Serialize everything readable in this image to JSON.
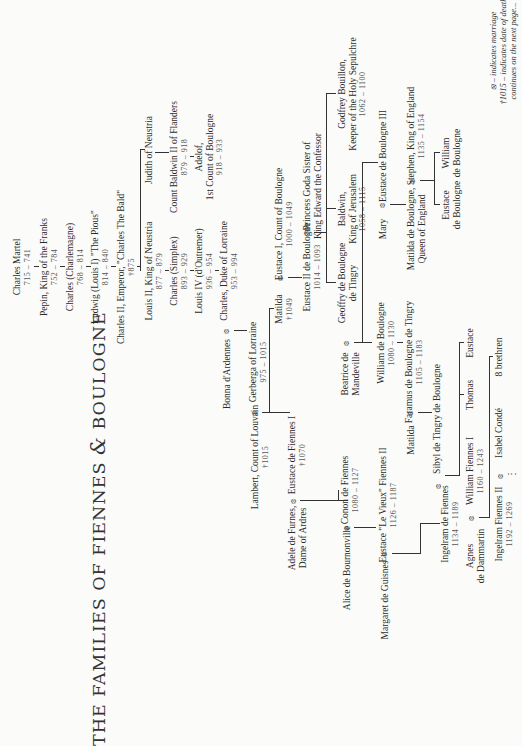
{
  "title": {
    "part1": "THE FAMILIES OF FIENNES ",
    "amp": "&",
    "part2": " BOULOGNE"
  },
  "marriage_symbol": "⦻",
  "people": {
    "charles_martel": {
      "name": "Charles Martel",
      "dates": "715 – 741"
    },
    "pepin": {
      "name": "Pepin, King of the Franks",
      "dates": "752 – 784"
    },
    "charlemagne": {
      "name": "Charles (Charlemagne)",
      "dates": "768 – 814"
    },
    "ludwig": {
      "name": "Ludwig (Louis I) \"The Pious\"",
      "dates": "814 – 840"
    },
    "charles_ii": {
      "name": "Charles II, Emperor, \"Charles The Bald\"",
      "dates": "†875"
    },
    "louis_ii": {
      "name": "Louis II, King of Neustria",
      "dates": "877 – 879"
    },
    "judith": {
      "name": "Judith of Neustria",
      "dates": ""
    },
    "charles_simplex": {
      "name": "Charles (Simplex)",
      "dates": "893 – 929"
    },
    "baldwin_ii": {
      "name": "Count Baldwin II of Flanders",
      "dates": "879 – 918"
    },
    "adelof": {
      "name": "Adelof,",
      "name2": "1st Count of Boulogne",
      "dates": "918 – 933"
    },
    "louis_iv": {
      "name": "Louis IV (d'Outremer)",
      "dates": "936 – 954"
    },
    "charles_lorraine": {
      "name": "Charles, Duke of Lorraine",
      "dates": "953 – 994"
    },
    "bonna": {
      "name": "Bonna d'Ardennes"
    },
    "gerberga": {
      "name": "Gerberga of Lorraine",
      "dates": "975 – 1015"
    },
    "matilda_1049": {
      "name": "Matilda",
      "dates": "†1049"
    },
    "eustace_i": {
      "name": "Eustace I, Count of Boulogne",
      "dates": "1000 – 1049"
    },
    "eustace_ii": {
      "name": "Eustace II de Boulogne",
      "dates": "1014 – 1093"
    },
    "goda": {
      "name": "Princess Goda Sister of",
      "name2": "King Edward the Confessor"
    },
    "lambert": {
      "name": "Lambert, Count of Louvain",
      "dates": "†1015"
    },
    "eustace_fiennes_i": {
      "name": "Eustace de Fiennes I",
      "dates": "†1070"
    },
    "adele": {
      "name": "Adele de Furnes,",
      "name2": "Dame of Ardres"
    },
    "beatrice": {
      "name": "Beatrice de",
      "name2": "Mandeville"
    },
    "geoffry": {
      "name": "Geoffry de Boulogne",
      "name2": "de Tingry"
    },
    "baldwin_jerusalem": {
      "name": "Baldwin,",
      "name2": "King of Jerusalem",
      "dates": "1058 – 1115"
    },
    "godfrey": {
      "name": "Godfrey Bouillon,",
      "name2": "Keeper of the Holy Sepulchre",
      "dates": "1062 – 1100"
    },
    "william_boulogne": {
      "name": "William de Boulogne",
      "dates": "1080 – 1130"
    },
    "faramus": {
      "name": "Faramus de Boulogne de Tingry",
      "dates": "1105 – 1183"
    },
    "matilda_2": {
      "name": "Matilda"
    },
    "mary": {
      "name": "Mary"
    },
    "eustace_iii": {
      "name": "Eustace de Boulogne III"
    },
    "matilda_queen": {
      "name": "Matilda de Boulogne,",
      "name2": "Queen of England"
    },
    "stephen": {
      "name": "Stephen, King of England",
      "dates": "1135 – 1154"
    },
    "eustace_son": {
      "name": "Eustace",
      "name2": "de Boulogne"
    },
    "william_son": {
      "name": "William",
      "name2": "de Boulogne"
    },
    "conon": {
      "name": "Conon de Fiennes",
      "dates": "1080 – 1127"
    },
    "alice": {
      "name": "Alice de Bournonville"
    },
    "eustace_le_vieux": {
      "name": "Eustace \"Le Vieux\" Fiennes II",
      "dates": "1126 – 1187"
    },
    "margaret": {
      "name": "Margaret de Guisnes"
    },
    "sibyl": {
      "name": "Sibyl de Tingry de Boulogne"
    },
    "thomas": {
      "name": "Thomas"
    },
    "eustace_sibyl": {
      "name": "Eustace"
    },
    "ingelram": {
      "name": "Ingelram de Fiennes",
      "dates": "1134 – 1189"
    },
    "william_fiennes_i": {
      "name": "William Fiennes I",
      "dates": "1160 – 1243"
    },
    "agnes": {
      "name": "Agnes",
      "name2": "de Dammartin"
    },
    "isabel": {
      "name": "Isabel Condé"
    },
    "brethren": {
      "name": "8 brethren"
    },
    "ingelram_ii": {
      "name": "Ingelram Fiennes II",
      "dates": "1192 – 1269"
    }
  },
  "continuation": "⋮",
  "legend": {
    "line1": "⦻ – indicates marriage",
    "line2": "†1015 – indicates date of death",
    "line3": "continues on the next page..."
  }
}
